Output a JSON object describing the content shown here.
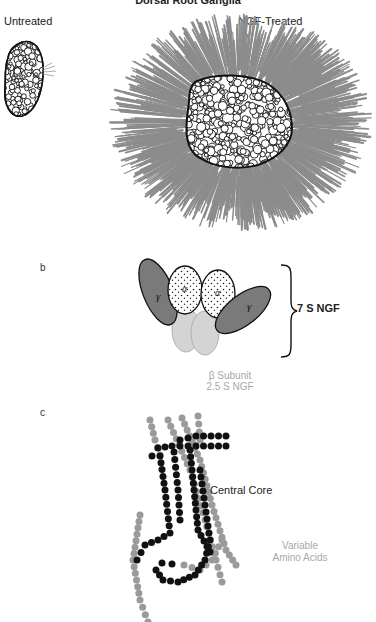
{
  "figure": {
    "title": "Dorsal Root Ganglia",
    "panel_a": {
      "untreated_label": "Untreated",
      "treated_label": "NGF-Treated"
    },
    "panel_b": {
      "letter": "b",
      "alpha_label": "α",
      "gamma_label": "γ",
      "complex_label": "7 S NGF",
      "beta_line1": "β Subunit",
      "beta_line2": "2.5 S NGF"
    },
    "panel_c": {
      "letter": "c",
      "core_label": "Central Core",
      "variable_line1": "Variable",
      "variable_line2": "Amino Acids"
    }
  },
  "colors": {
    "outline": "#111111",
    "neurite_gray": "#8c8c8c",
    "gamma_fill": "#7a7a7a",
    "beta_fill": "#d4d4d4",
    "bead_core": "#111111",
    "bead_variable": "#9a9a9a",
    "label_light": "#a8a8a8"
  },
  "chains": {
    "variable": [
      [
        [
          168,
          420
        ],
        [
          190,
          470
        ],
        [
          205,
          520
        ],
        [
          216,
          560
        ],
        [
          222,
          582
        ]
      ],
      [
        [
          182,
          418
        ],
        [
          200,
          460
        ],
        [
          212,
          505
        ],
        [
          226,
          550
        ],
        [
          236,
          565
        ]
      ],
      [
        [
          140,
          515
        ],
        [
          133,
          560
        ],
        [
          140,
          600
        ],
        [
          148,
          622
        ]
      ],
      [
        [
          184,
          565
        ],
        [
          200,
          570
        ],
        [
          212,
          560
        ],
        [
          222,
          540
        ]
      ],
      [
        [
          150,
          420
        ],
        [
          155,
          440
        ],
        [
          160,
          455
        ]
      ],
      [
        [
          198,
          416
        ],
        [
          200,
          440
        ]
      ]
    ],
    "core": [
      [
        [
          152,
          456
        ],
        [
          158,
          448
        ],
        [
          172,
          446
        ],
        [
          196,
          446
        ],
        [
          226,
          446
        ]
      ],
      [
        [
          180,
          440
        ],
        [
          196,
          436
        ],
        [
          226,
          436
        ]
      ],
      [
        [
          160,
          456
        ],
        [
          165,
          490
        ],
        [
          170,
          533
        ],
        [
          158,
          540
        ],
        [
          145,
          545
        ],
        [
          137,
          560
        ]
      ],
      [
        [
          174,
          452
        ],
        [
          178,
          490
        ],
        [
          180,
          520
        ]
      ],
      [
        [
          190,
          450
        ],
        [
          194,
          490
        ],
        [
          198,
          530
        ],
        [
          210,
          552
        ]
      ],
      [
        [
          200,
          470
        ],
        [
          205,
          505
        ],
        [
          210,
          540
        ],
        [
          205,
          560
        ],
        [
          195,
          575
        ],
        [
          178,
          582
        ],
        [
          163,
          580
        ],
        [
          156,
          570
        ],
        [
          162,
          563
        ],
        [
          172,
          564
        ]
      ]
    ]
  }
}
